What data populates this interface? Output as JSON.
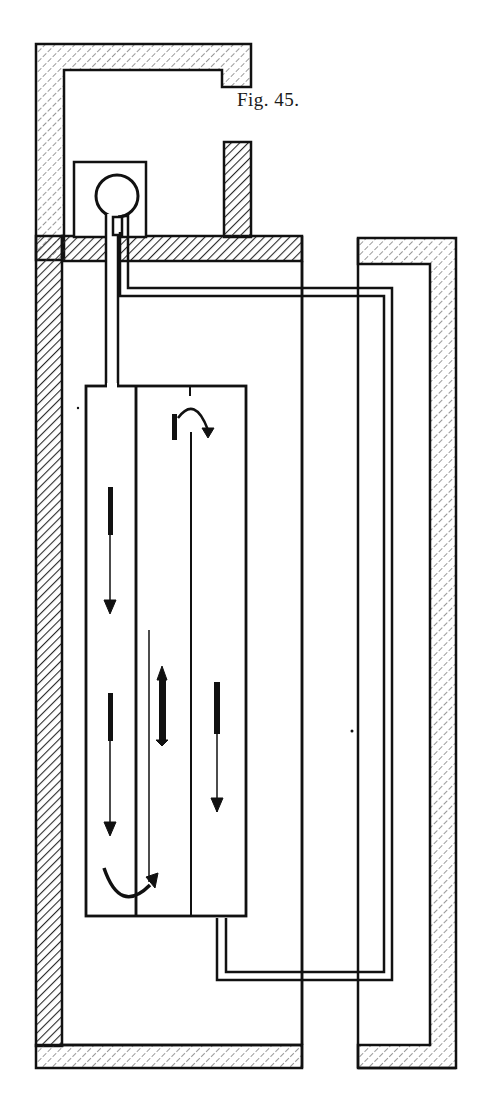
{
  "figure": {
    "caption": "Fig. 45.",
    "colors": {
      "ink": "#111111",
      "background": "#ffffff",
      "hatch": "#2a2a2a"
    }
  },
  "diagram": {
    "elements": [
      "outer-enclosure-wall-left",
      "top-chimney-flue",
      "boiler-sphere",
      "short-chimney-stack",
      "ceiling-slab",
      "inner-tank-left-chamber",
      "inner-tank-right-chamber",
      "flow-pipe",
      "return-pipe",
      "right-enclosure-wall",
      "floor-slab-left",
      "floor-slab-right"
    ],
    "flow_arrows": [
      {
        "name": "curved-arrow-top-right",
        "direction": "clockwise"
      },
      {
        "name": "down-arrow-left-upper",
        "direction": "down"
      },
      {
        "name": "down-arrow-left-lower",
        "direction": "down"
      },
      {
        "name": "up-arrow-middle",
        "direction": "up"
      },
      {
        "name": "down-arrow-right",
        "direction": "down"
      },
      {
        "name": "curved-arrow-bottom",
        "direction": "counterclockwise"
      }
    ]
  }
}
